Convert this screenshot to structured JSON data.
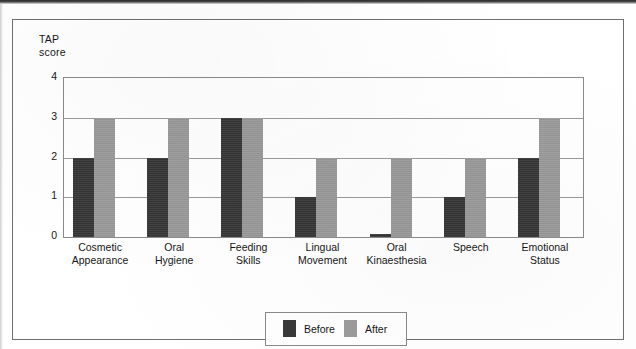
{
  "figure": {
    "y_axis_title": "TAP\nscore"
  },
  "legend": {
    "entries": [
      {
        "label": "Before",
        "color": "#383838",
        "swatch_name": "legend-swatch-before"
      },
      {
        "label": "After",
        "color": "#9b9b9b",
        "swatch_name": "legend-swatch-after"
      }
    ]
  },
  "chart_data": {
    "type": "bar",
    "title": "",
    "subtitle": "",
    "xlabel": "",
    "ylabel": "TAP score",
    "ylim": [
      0,
      4
    ],
    "ytick_labels": [
      "4",
      "3",
      "2",
      "1",
      "0"
    ],
    "yticks": [
      4,
      3,
      2,
      1,
      0
    ],
    "grid": true,
    "legend_position": "bottom-center",
    "categories": [
      "Cosmetic\nAppearance",
      "Oral\nHygiene",
      "Feeding\nSkills",
      "Lingual\nMovement",
      "Oral\nKinaesthesia",
      "Speech",
      "Emotional\nStatus"
    ],
    "series": [
      {
        "name": "Before",
        "color": "#383838",
        "values": [
          2,
          2,
          3,
          1,
          0.07,
          1,
          2
        ]
      },
      {
        "name": "After",
        "color": "#9b9b9b",
        "values": [
          3,
          3,
          3,
          2,
          2,
          2,
          3
        ]
      }
    ]
  }
}
